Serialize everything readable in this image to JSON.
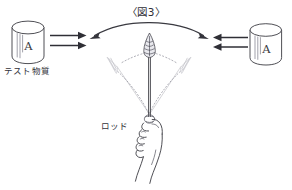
{
  "figure": {
    "title": "〈図3〉",
    "title_icon": "figure-number-bracket",
    "background_color": "#ffffff",
    "ink_color": "#3b3b42",
    "faint_ink_color": "#9a9aa4",
    "width": 292,
    "height": 190
  },
  "labels": {
    "test_substance": "テスト物質",
    "rod": "ロッド"
  },
  "containers": [
    {
      "id": "left-cylinder",
      "letter": "A",
      "side": "left",
      "caption": "テスト物質",
      "hatch_lines": 3
    },
    {
      "id": "right-cylinder",
      "letter": "A",
      "side": "right",
      "caption": "",
      "hatch_lines": 3
    }
  ],
  "arrows": {
    "left_group": {
      "count": 2,
      "direction": "right",
      "name": "influence-arrows-left"
    },
    "right_group": {
      "count": 2,
      "direction": "left",
      "name": "influence-arrows-right"
    },
    "swing_arc": {
      "direction": "double",
      "name": "swing-arc-arrow"
    }
  },
  "rod": {
    "name": "dowsing-rod",
    "tip_shape": "leaf-point",
    "ghost_positions": [
      "left",
      "right"
    ],
    "swing_paths": 2,
    "held_by": "hand"
  },
  "hand": {
    "name": "hand-gripping-rod",
    "fingers": 4
  }
}
